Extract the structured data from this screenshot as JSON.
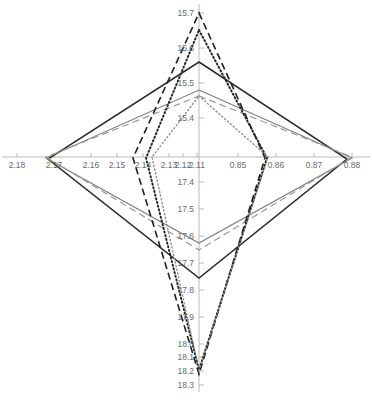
{
  "chart_data": {
    "type": "line",
    "subtype": "radar-star-4-axis",
    "title": "",
    "xlabel": "",
    "ylabel": "",
    "grid": false,
    "legend": "none",
    "center": {
      "x": 199,
      "y": 157
    },
    "axes": [
      {
        "name": "top",
        "direction": "up",
        "ticks": [
          "15.7",
          "15.6",
          "15.5",
          "15.4"
        ],
        "tick_values": [
          15.7,
          15.6,
          15.5,
          15.4
        ],
        "tick_px": [
          13,
          48,
          83,
          118
        ],
        "label_align": "vert"
      },
      {
        "name": "right",
        "direction": "right",
        "ticks": [
          "0.85",
          "0.86",
          "0.87",
          "0.88"
        ],
        "tick_values": [
          0.85,
          0.86,
          0.87,
          0.88
        ],
        "tick_px": [
          238,
          276,
          314,
          352
        ],
        "label_align": "right"
      },
      {
        "name": "bottom",
        "direction": "down",
        "ticks": [
          "17.4",
          "17.5",
          "17.6",
          "17.7",
          "17.8",
          "17.9",
          "18.0",
          "18.1",
          "18.2",
          "18.3"
        ],
        "tick_values": [
          17.4,
          17.5,
          17.6,
          17.7,
          17.8,
          17.9,
          18.0,
          18.1,
          18.2,
          18.3
        ],
        "tick_px": [
          182,
          209,
          236,
          263,
          290,
          317,
          344,
          357,
          371,
          385
        ],
        "label_align": "vert"
      },
      {
        "name": "left",
        "direction": "left",
        "ticks": [
          "2.18",
          "2.17",
          "2.16",
          "2.15",
          "2.14",
          "2.13",
          "2.12",
          "2.11"
        ],
        "tick_values": [
          2.18,
          2.17,
          2.16,
          2.15,
          2.14,
          2.13,
          2.12,
          2.11
        ],
        "tick_px": [
          17,
          54,
          91,
          117,
          143,
          169,
          183,
          197
        ],
        "label_align": "left"
      }
    ],
    "series": [
      {
        "name": "series-1",
        "style": "solid",
        "color": "#2b2b2b",
        "width": 1.5,
        "vertices_px": {
          "top": [
            199,
            62
          ],
          "right": [
            347,
            159
          ],
          "bottom": [
            199,
            278
          ],
          "left": [
            48,
            159
          ]
        },
        "values": {
          "top": 15.56,
          "right": 0.8797,
          "bottom": 17.75,
          "left": 2.1655
        }
      },
      {
        "name": "series-2",
        "style": "solid",
        "color": "#7f7f76",
        "width": 1.1,
        "vertices_px": {
          "top": [
            199,
            90
          ],
          "right": [
            352,
            158
          ],
          "bottom": [
            199,
            243
          ],
          "left": [
            46,
            158
          ]
        },
        "values": {
          "top": 15.48,
          "right": 0.881,
          "bottom": 17.62,
          "left": 2.1645
        }
      },
      {
        "name": "series-3",
        "style": "dashed",
        "color": "#9a9a92",
        "width": 1.2,
        "vertices_px": {
          "top": [
            199,
            96
          ],
          "right": [
            352,
            157
          ],
          "bottom": [
            199,
            250
          ],
          "left": [
            46,
            157
          ]
        },
        "values": {
          "top": 15.465,
          "right": 0.881,
          "bottom": 17.645,
          "left": 2.1645
        }
      },
      {
        "name": "series-4",
        "style": "dashed",
        "color": "#1f1f1f",
        "width": 1.6,
        "vertices_px": {
          "top": [
            199,
            13
          ],
          "right": [
            265,
            158
          ],
          "bottom": [
            199,
            374
          ],
          "left": [
            133,
            158
          ]
        },
        "values": {
          "top": 15.7,
          "right": 0.8597,
          "bottom": 18.22,
          "left": 2.1305
        }
      },
      {
        "name": "series-5",
        "style": "dotted",
        "color": "#262626",
        "width": 2.0,
        "vertices_px": {
          "top": [
            199,
            30
          ],
          "right": [
            267,
            158
          ],
          "bottom": [
            199,
            370
          ],
          "left": [
            146,
            158
          ]
        },
        "values": {
          "top": 15.65,
          "right": 0.8602,
          "bottom": 18.205,
          "left": 2.1255
        }
      },
      {
        "name": "series-6",
        "style": "dotted",
        "color": "#8d8d85",
        "width": 1.4,
        "vertices_px": {
          "top": [
            199,
            96
          ],
          "right": [
            268,
            157
          ],
          "bottom": [
            199,
            370
          ],
          "left": [
            152,
            157
          ]
        },
        "values": {
          "top": 15.465,
          "right": 0.8605,
          "bottom": 18.205,
          "left": 2.1235
        }
      }
    ],
    "axis_line_color": "#b9b9b1",
    "tick_label_color": "#6b6b63",
    "background": "#ffffff"
  }
}
